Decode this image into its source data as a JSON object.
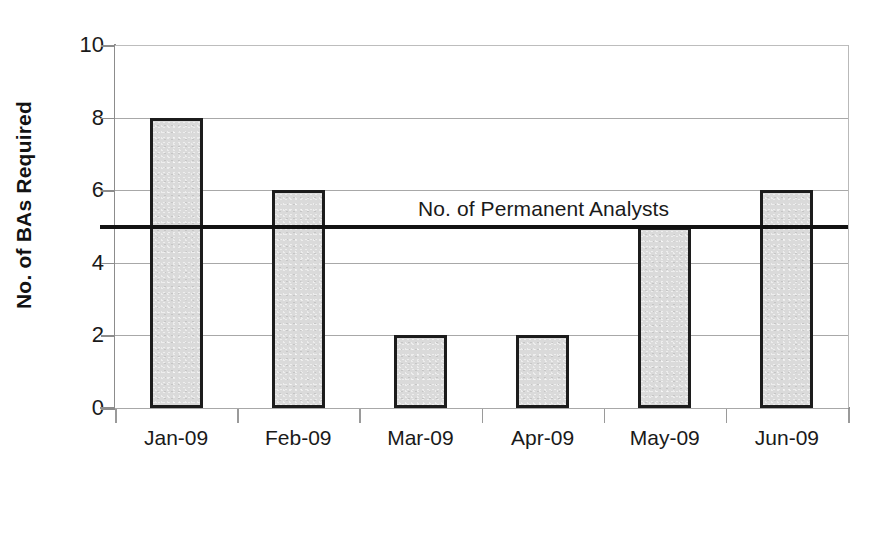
{
  "chart_data": {
    "type": "bar",
    "title": "",
    "categories": [
      "Jan-09",
      "Feb-09",
      "Mar-09",
      "Apr-09",
      "May-09",
      "Jun-09"
    ],
    "values": [
      8,
      6,
      2,
      2,
      5,
      6
    ],
    "series": [
      {
        "name": "No. of BAs Required",
        "values": [
          8,
          6,
          2,
          2,
          5,
          6
        ]
      }
    ],
    "xlabel": "Month",
    "ylabel": "No. of BAs Required",
    "ylim": [
      0,
      10
    ],
    "ytick_labels": [
      "0",
      "2",
      "4",
      "6",
      "8",
      "10"
    ],
    "ytick_values": [
      0,
      2,
      4,
      6,
      8,
      10
    ],
    "grid": true,
    "grid_axis": "y",
    "legend": "none",
    "annotations": [
      {
        "kind": "reference-line",
        "label": "No. of Permanent Analysts",
        "value": 5,
        "orientation": "horizontal"
      }
    ],
    "colors": {
      "bar_fill": "#dadada",
      "bar_border": "#1c1c1c",
      "reference_line": "#121212",
      "gridline": "#a8a8a8",
      "axis": "#8c8c8c",
      "text": "#1a1a1a",
      "background": "#ffffff"
    }
  }
}
